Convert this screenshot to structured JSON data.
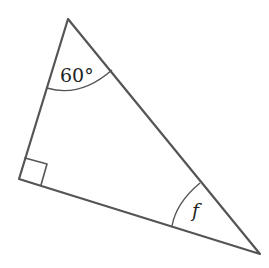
{
  "diagram": {
    "type": "right-triangle",
    "vertices": {
      "top": [
        68,
        19
      ],
      "left": [
        19,
        179
      ],
      "right": [
        260,
        254
      ]
    },
    "angles": {
      "top": {
        "label": "60°",
        "value_degrees": 60
      },
      "left": {
        "label": "",
        "marker": "right-angle",
        "value_degrees": 90
      },
      "right": {
        "label": "f"
      }
    },
    "colors": {
      "stroke": "#555555",
      "text": "#222222",
      "background": "#ffffff"
    }
  }
}
